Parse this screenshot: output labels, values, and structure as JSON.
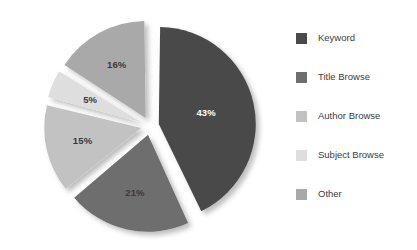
{
  "chart_data": {
    "type": "pie",
    "title": "",
    "subtitle": "",
    "xlabel": "",
    "ylabel": "",
    "grid": false,
    "legend_position": "right",
    "exploded": true,
    "start_angle_deg": 0,
    "direction": "clockwise",
    "categories": [
      "Keyword",
      "Title Browse",
      "Author Browse",
      "Subject Browse",
      "Other"
    ],
    "values": [
      43,
      21,
      15,
      5,
      16
    ],
    "value_unit": "%",
    "data_labels": [
      "43%",
      "21%",
      "15%",
      "5%",
      "16%"
    ],
    "colors": [
      "#4a4a4a",
      "#6e6e6e",
      "#c2c2c2",
      "#dedede",
      "#a9a9a9"
    ],
    "label_colors": [
      "#ffffff",
      "#3a3a3a",
      "#3a3a3a",
      "#3a3a3a",
      "#3a3a3a"
    ],
    "slices": [
      {
        "label": "Keyword",
        "value": 43,
        "data_label": "43%",
        "color": "#4a4a4a",
        "label_color": "#ffffff"
      },
      {
        "label": "Title Browse",
        "value": 21,
        "data_label": "21%",
        "color": "#6e6e6e",
        "label_color": "#3a3a3a"
      },
      {
        "label": "Author Browse",
        "value": 15,
        "data_label": "15%",
        "color": "#c2c2c2",
        "label_color": "#3a3a3a"
      },
      {
        "label": "Subject Browse",
        "value": 5,
        "data_label": "5%",
        "color": "#dedede",
        "label_color": "#3a3a3a"
      },
      {
        "label": "Other",
        "value": 16,
        "data_label": "16%",
        "color": "#a9a9a9",
        "label_color": "#3a3a3a"
      }
    ]
  },
  "legend": {
    "items": [
      {
        "label": "Keyword",
        "color": "#4a4a4a"
      },
      {
        "label": "Title Browse",
        "color": "#6e6e6e"
      },
      {
        "label": "Author Browse",
        "color": "#c2c2c2"
      },
      {
        "label": "Subject Browse",
        "color": "#dedede"
      },
      {
        "label": "Other",
        "color": "#a9a9a9"
      }
    ]
  },
  "style": {
    "background": "#ffffff",
    "shadow_color": "rgba(0,0,0,0.20)"
  }
}
